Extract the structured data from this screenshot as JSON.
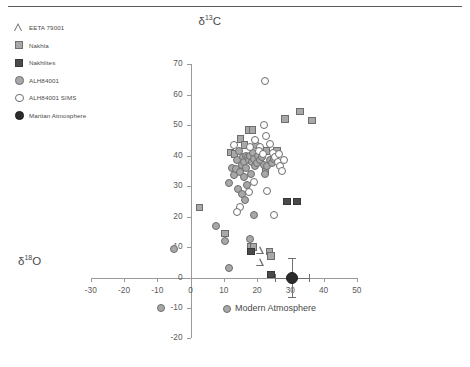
{
  "chart_data": {
    "type": "scatter",
    "title": "",
    "xlabel": "δ¹⁸O",
    "ylabel": "δ¹³C",
    "xlim": [
      -30,
      50
    ],
    "ylim": [
      -20,
      70
    ],
    "xticks": [
      -30,
      -20,
      -10,
      0,
      10,
      20,
      30,
      40,
      50
    ],
    "yticks": [
      -20,
      -10,
      0,
      10,
      20,
      30,
      40,
      50,
      60,
      70
    ],
    "grid": false,
    "legend_position": "top-left",
    "annotations": [
      {
        "text": "Modern Atmosphere",
        "x": 30.5,
        "y": 0
      }
    ],
    "series": [
      {
        "name": "EETA 79001",
        "marker": "triangle-open",
        "color": "#6d6d6d",
        "points": [
          [
            21.0,
            9.0
          ],
          [
            21.0,
            5.0
          ]
        ]
      },
      {
        "name": "Nakhla",
        "marker": "square",
        "color": "#a8a8a8",
        "points": [
          [
            2.7,
            23.0
          ],
          [
            10.3,
            14.5
          ],
          [
            12.0,
            41.0
          ],
          [
            13.2,
            40.5
          ],
          [
            15.0,
            45.5
          ],
          [
            16.3,
            43.5
          ],
          [
            17.5,
            48.5
          ],
          [
            18.6,
            48.5
          ],
          [
            18.0,
            10.0
          ],
          [
            19.0,
            10.0
          ],
          [
            22.5,
            35.0
          ],
          [
            22.8,
            41.5
          ],
          [
            23.7,
            8.5
          ],
          [
            24.3,
            7.0
          ],
          [
            26.0,
            41.5
          ],
          [
            28.5,
            52.0
          ],
          [
            33.0,
            54.5
          ],
          [
            36.5,
            51.5
          ]
        ]
      },
      {
        "name": "Nakhlites",
        "marker": "square-filled",
        "color": "#4a4a4a",
        "points": [
          [
            18.2,
            8.5
          ],
          [
            24.3,
            1.0
          ],
          [
            29.0,
            25.0
          ],
          [
            32.0,
            25.0
          ]
        ]
      },
      {
        "name": "ALH84001",
        "marker": "circle",
        "color": "#a8a8a8",
        "points": [
          [
            -5.0,
            9.5
          ],
          [
            -9.0,
            -10.0
          ],
          [
            7.8,
            17.0
          ],
          [
            10.4,
            12.0
          ],
          [
            11.5,
            3.0
          ],
          [
            11.0,
            -10.5
          ],
          [
            11.5,
            31.0
          ],
          [
            12.5,
            36.0
          ],
          [
            13.2,
            33.5
          ],
          [
            13.8,
            35.5
          ],
          [
            14.0,
            38.5
          ],
          [
            14.5,
            41.5
          ],
          [
            14.3,
            29.0
          ],
          [
            15.0,
            34.5
          ],
          [
            15.4,
            37.0
          ],
          [
            15.8,
            39.5
          ],
          [
            16.2,
            38.0
          ],
          [
            16.6,
            40.0
          ],
          [
            16.0,
            33.0
          ],
          [
            16.8,
            36.0
          ],
          [
            17.2,
            39.5
          ],
          [
            17.6,
            38.5
          ],
          [
            17.0,
            30.5
          ],
          [
            18.0,
            40.0
          ],
          [
            18.4,
            38.0
          ],
          [
            18.2,
            34.0
          ],
          [
            18.8,
            41.0
          ],
          [
            19.2,
            39.0
          ],
          [
            19.5,
            36.5
          ],
          [
            15.5,
            27.5
          ],
          [
            16.5,
            25.5
          ],
          [
            18.0,
            12.5
          ],
          [
            19.8,
            43.5
          ],
          [
            20.4,
            40.0
          ],
          [
            20.0,
            37.5
          ],
          [
            20.8,
            38.5
          ],
          [
            21.5,
            39.5
          ],
          [
            22.0,
            37.0
          ],
          [
            22.5,
            34.0
          ],
          [
            23.0,
            36.5
          ],
          [
            19.0,
            20.5
          ],
          [
            24.0,
            38.5
          ],
          [
            24.6,
            37.5
          ],
          [
            25.2,
            39.0
          ]
        ]
      },
      {
        "name": "ALH84001 SIMS",
        "marker": "circle-open",
        "color": "#6d6d6d",
        "points": [
          [
            22.5,
            64.5
          ],
          [
            19.5,
            45.0
          ],
          [
            22.0,
            50.0
          ],
          [
            22.8,
            46.5
          ],
          [
            24.0,
            44.0
          ],
          [
            24.8,
            41.0
          ],
          [
            25.5,
            39.5
          ],
          [
            26.2,
            38.0
          ],
          [
            26.8,
            36.5
          ],
          [
            27.4,
            35.0
          ],
          [
            25.0,
            20.5
          ],
          [
            23.0,
            28.5
          ],
          [
            26.5,
            40.5
          ],
          [
            28.0,
            38.5
          ],
          [
            21.0,
            43.0
          ],
          [
            20.5,
            41.5
          ],
          [
            21.8,
            40.5
          ],
          [
            17.8,
            43.0
          ],
          [
            13.0,
            43.5
          ],
          [
            19.0,
            31.5
          ],
          [
            17.5,
            28.0
          ],
          [
            15.0,
            23.0
          ],
          [
            14.0,
            21.5
          ]
        ]
      },
      {
        "name": "Martian Atmosphere",
        "marker": "circle-black",
        "color": "#2b2b2b",
        "points": [
          [
            30.5,
            0.0
          ]
        ],
        "xerr": 5.0,
        "yerr": 6.5
      }
    ]
  },
  "legend": {
    "items": [
      {
        "label": "EETA 79001",
        "marker": "triangle-open"
      },
      {
        "label": "Nakhla",
        "marker": "square"
      },
      {
        "label": "Nakhlites",
        "marker": "square-filled"
      },
      {
        "label": "ALH84001",
        "marker": "circle"
      },
      {
        "label": "ALH84001 SIMS",
        "marker": "circle-open"
      },
      {
        "label": "Martian Atmosphere",
        "marker": "circle-black"
      }
    ]
  }
}
